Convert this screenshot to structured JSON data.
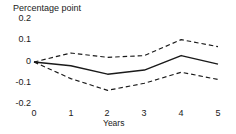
{
  "chart_data": {
    "type": "line",
    "title": "",
    "ylabel": "Percentage point",
    "xlabel": "Years",
    "x": [
      0,
      1,
      2,
      3,
      4,
      5
    ],
    "xtick_labels": [
      "0",
      "1",
      "2",
      "3",
      "4",
      "5"
    ],
    "ytick_labels": [
      "0.2",
      "0.1",
      "0",
      "-0.1",
      "-0.2"
    ],
    "yticks": [
      0.2,
      0.1,
      0,
      -0.1,
      -0.2
    ],
    "ylim": [
      -0.2,
      0.2
    ],
    "xlim": [
      0,
      5
    ],
    "grid": false,
    "legend_position": "none",
    "zero_line": true,
    "series": [
      {
        "name": "Upper confidence band",
        "style": "dashed",
        "color": "#1a1a1a",
        "values": [
          0.0,
          0.042,
          0.022,
          0.03,
          0.105,
          0.072
        ]
      },
      {
        "name": "Point estimate",
        "style": "solid",
        "color": "#1a1a1a",
        "values": [
          0.0,
          -0.018,
          -0.057,
          -0.038,
          0.03,
          -0.01
        ]
      },
      {
        "name": "Lower confidence band",
        "style": "dashed",
        "color": "#1a1a1a",
        "values": [
          0.0,
          -0.078,
          -0.133,
          -0.1,
          -0.048,
          -0.082
        ]
      }
    ]
  },
  "axes": {
    "y_title": "Percentage point",
    "x_title": "Years",
    "y_ticks": [
      {
        "label": "0.2"
      },
      {
        "label": "0.1"
      },
      {
        "label": "0"
      },
      {
        "label": "-0.1"
      },
      {
        "label": "-0.2"
      }
    ],
    "x_ticks": [
      {
        "label": "0"
      },
      {
        "label": "1"
      },
      {
        "label": "2"
      },
      {
        "label": "3"
      },
      {
        "label": "4"
      },
      {
        "label": "5"
      }
    ]
  },
  "style": {
    "line_color": "#1a1a1a",
    "background": "#ffffff"
  }
}
